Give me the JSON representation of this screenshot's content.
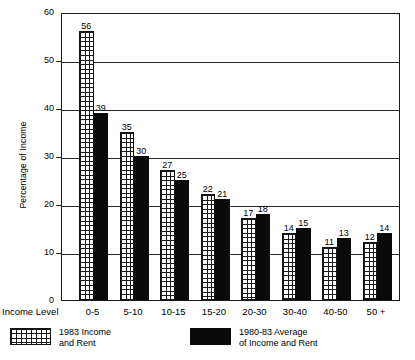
{
  "chart_data": {
    "type": "bar",
    "title": "",
    "xlabel": "Income Level",
    "ylabel": "Percentage of Income",
    "ylim": [
      0,
      60
    ],
    "yticks": [
      0,
      10,
      20,
      30,
      40,
      50,
      60
    ],
    "grid": true,
    "legend_position": "bottom",
    "categories": [
      "0-5",
      "5-10",
      "10-15",
      "15-20",
      "20-30",
      "30-40",
      "40-50",
      "50 +"
    ],
    "series": [
      {
        "name": "1983 Income and Rent",
        "name_line1": "1983 Income",
        "name_line2": "and Rent",
        "pattern": "grid-hatch",
        "values": [
          56,
          35,
          27,
          22,
          17,
          14,
          11,
          12
        ]
      },
      {
        "name": "1980-83 Average of Income and Rent",
        "name_line1": "1980-83 Average",
        "name_line2": "of Income and Rent",
        "pattern": "solid-black",
        "color": "#0a0a0a",
        "values": [
          39,
          30,
          25,
          21,
          18,
          15,
          13,
          14
        ]
      }
    ]
  },
  "axis": {
    "y_title": "Percentage of Income",
    "x_title": "Income Level",
    "y_tick_labels": [
      "60",
      "50",
      "40",
      "30",
      "20",
      "10",
      "0"
    ],
    "x_tick_labels": [
      "0-5",
      "5-10",
      "10-15",
      "15-20",
      "20-30",
      "30-40",
      "40-50",
      "50 +"
    ]
  },
  "legend": {
    "items": [
      {
        "line1": "1983 Income",
        "line2": "and Rent",
        "swatch": "grid-hatch"
      },
      {
        "line1": "1980-83 Average",
        "line2": "of Income and Rent",
        "swatch": "solid-black"
      }
    ]
  }
}
